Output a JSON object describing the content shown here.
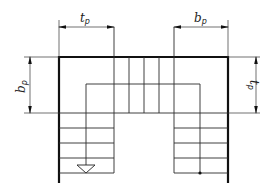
{
  "diagram": {
    "dimensions": {
      "top_left": {
        "main": "t",
        "sub": "p"
      },
      "top_right": {
        "main": "b",
        "sub": "p"
      },
      "left": {
        "main": "b",
        "sub": "p"
      },
      "right": {
        "main": "t",
        "sub": "p"
      }
    },
    "symbols": {
      "start_arrow": "down-triangle-icon",
      "end_dot": "dot-icon"
    },
    "colors": {
      "line": "#111111",
      "background": "#ffffff"
    }
  }
}
